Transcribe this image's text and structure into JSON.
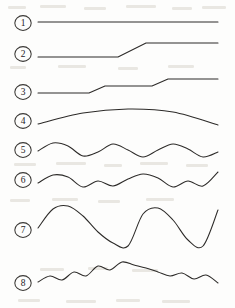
{
  "figure": {
    "background_color": "#fdfdfc",
    "stroke_color": "#2c2a28",
    "label_color": "#23211f",
    "width": 235,
    "height": 308
  },
  "chart_data": {
    "type": "line",
    "xlabel": "",
    "ylabel": "",
    "grid": false,
    "legend": "left-circled-numbers",
    "xlim": [
      38,
      218
    ],
    "series": [
      {
        "name": "1",
        "label": "1",
        "description": "flat constant level line",
        "label_x": 23,
        "label_y": 23,
        "x": [
          38,
          83,
          128,
          173,
          218
        ],
        "y": [
          22,
          22,
          22,
          22,
          22
        ]
      },
      {
        "name": "2",
        "label": "2",
        "description": "single upward step",
        "label_x": 23,
        "label_y": 54,
        "x": [
          38,
          118,
          146,
          218
        ],
        "y": [
          57,
          57,
          43,
          43
        ]
      },
      {
        "name": "3",
        "label": "3",
        "description": "two-level staircase",
        "label_x": 23,
        "label_y": 92,
        "x": [
          38,
          89,
          105,
          152,
          168,
          218
        ],
        "y": [
          93,
          93,
          86,
          86,
          79,
          79
        ]
      },
      {
        "name": "4",
        "label": "4",
        "description": "shallow convex arc",
        "label_x": 23,
        "label_y": 121,
        "x": [
          38,
          83,
          128,
          173,
          218
        ],
        "y": [
          124,
          113,
          109,
          112,
          125
        ]
      },
      {
        "name": "5",
        "label": "5",
        "description": "regular sine wave, three cycles",
        "label_x": 23,
        "label_y": 150,
        "x": [
          38,
          53,
          68,
          83,
          98,
          113,
          128,
          143,
          158,
          173,
          188,
          203,
          218
        ],
        "y": [
          151,
          143,
          146,
          156,
          152,
          144,
          150,
          157,
          150,
          144,
          149,
          157,
          152
        ]
      },
      {
        "name": "6",
        "label": "6",
        "description": "sine wave with superimposed small ripple",
        "label_x": 23,
        "label_y": 180,
        "x": [
          38,
          53,
          68,
          83,
          98,
          113,
          128,
          143,
          158,
          173,
          188,
          203,
          218
        ],
        "y": [
          183,
          175,
          177,
          187,
          181,
          186,
          179,
          174,
          178,
          187,
          181,
          186,
          172
        ]
      },
      {
        "name": "7",
        "label": "7",
        "description": "large amplitude low frequency wave",
        "label_x": 23,
        "label_y": 230,
        "x": [
          38,
          53,
          68,
          83,
          98,
          113,
          128,
          143,
          158,
          173,
          188,
          203,
          218
        ],
        "y": [
          228,
          209,
          206,
          216,
          232,
          243,
          246,
          214,
          208,
          220,
          240,
          246,
          210
        ]
      },
      {
        "name": "8",
        "label": "8",
        "description": "high frequency ripple over broad hump",
        "label_x": 23,
        "label_y": 283,
        "x": [
          38,
          50,
          62,
          74,
          86,
          98,
          110,
          122,
          134,
          146,
          158,
          170,
          182,
          194,
          206,
          218
        ],
        "y": [
          282,
          276,
          280,
          272,
          276,
          266,
          270,
          262,
          265,
          268,
          272,
          276,
          273,
          279,
          275,
          283
        ]
      }
    ]
  }
}
